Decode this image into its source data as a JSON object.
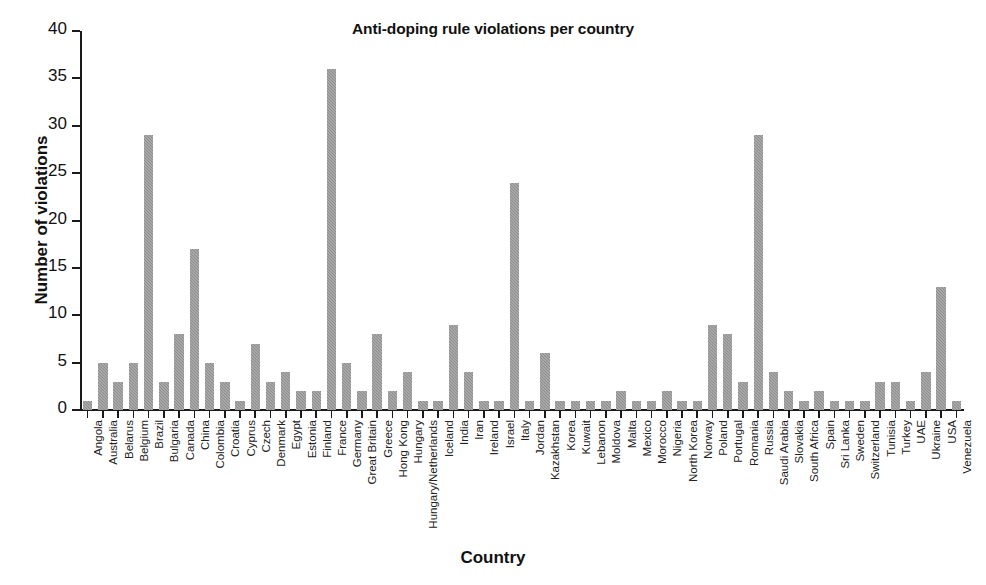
{
  "chart_data": {
    "type": "bar",
    "title": "Anti-doping rule violations per country",
    "xlabel": "Country",
    "ylabel": "Number of violations",
    "ylim": [
      0,
      40
    ],
    "yticks": [
      0,
      5,
      10,
      15,
      20,
      25,
      30,
      35,
      40
    ],
    "grid": false,
    "legend": null,
    "bar_color": "#8e8e8e",
    "categories": [
      "Angola",
      "Australia",
      "Belarus",
      "Belgium",
      "Brazil",
      "Bulgaria",
      "Canada",
      "China",
      "Colombia",
      "Croatia",
      "Cyprus",
      "Czech",
      "Denmark",
      "Egypt",
      "Estonia",
      "Finland",
      "France",
      "Germany",
      "Great Britain",
      "Greece",
      "Hong Kong",
      "Hungary",
      "Hungary/Netherlands",
      "Iceland",
      "India",
      "Iran",
      "Ireland",
      "Israel",
      "Italy",
      "Jordan",
      "Kazakhstan",
      "Korea",
      "Kuwait",
      "Lebanon",
      "Moldova",
      "Malta",
      "Mexico",
      "Morocco",
      "Nigeria",
      "North Korea",
      "Norway",
      "Poland",
      "Portugal",
      "Romania",
      "Russia",
      "Saudi Arabia",
      "Slovakia",
      "South Africa",
      "Spain",
      "Sri Lanka",
      "Sweden",
      "Switzerland",
      "Tunisia",
      "Turkey",
      "UAE",
      "Ukraine",
      "USA",
      "Venezuela"
    ],
    "values": [
      1,
      5,
      3,
      5,
      29,
      3,
      8,
      17,
      5,
      3,
      1,
      7,
      3,
      4,
      2,
      2,
      36,
      5,
      2,
      8,
      2,
      4,
      1,
      1,
      9,
      4,
      1,
      1,
      24,
      1,
      6,
      1,
      1,
      1,
      1,
      2,
      1,
      1,
      2,
      1,
      1,
      9,
      8,
      3,
      29,
      4,
      2,
      1,
      2,
      1,
      1,
      1,
      3,
      3,
      1,
      4,
      13,
      1
    ]
  }
}
